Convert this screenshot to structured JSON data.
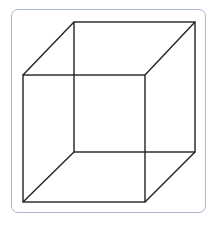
{
  "diagram": {
    "type": "necker-cube",
    "frame_color": "#a9b6cc",
    "line_color": "#222222",
    "front_face": {
      "x1": 23,
      "y1": 75,
      "x2": 145,
      "y2": 202
    },
    "back_face": {
      "x1": 74,
      "y1": 22,
      "x2": 195,
      "y2": 152
    }
  }
}
